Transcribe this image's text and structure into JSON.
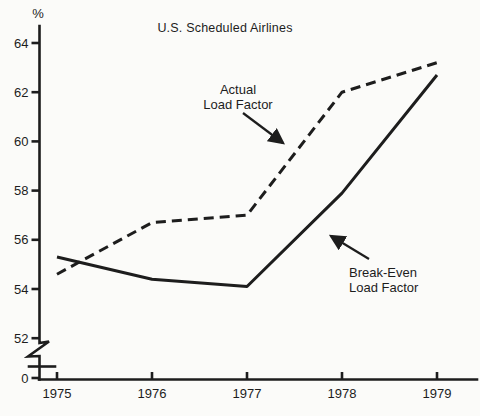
{
  "chart_data": {
    "type": "line",
    "title": "U.S. Scheduled Airlines",
    "ylabel": "%",
    "xlabel": "",
    "categories": [
      "1975",
      "1976",
      "1977",
      "1978",
      "1979"
    ],
    "y_ticks": [
      64,
      62,
      60,
      58,
      56,
      54,
      52,
      0
    ],
    "axis_break": true,
    "grid": false,
    "legend": "none",
    "line_color": "#1d1d1d",
    "series": [
      {
        "name": "Actual Load Factor",
        "style": "dashed",
        "values": [
          54.6,
          56.7,
          57.0,
          62.0,
          63.2
        ]
      },
      {
        "name": "Break-Even Load Factor",
        "style": "solid",
        "values": [
          55.3,
          54.4,
          54.1,
          57.9,
          62.7
        ]
      }
    ],
    "annotations": [
      {
        "lines": [
          "Actual",
          "Load Factor"
        ],
        "target_series": "Actual Load Factor"
      },
      {
        "lines": [
          "Break-Even",
          "Load Factor"
        ],
        "target_series": "Break-Even Load Factor"
      }
    ]
  }
}
